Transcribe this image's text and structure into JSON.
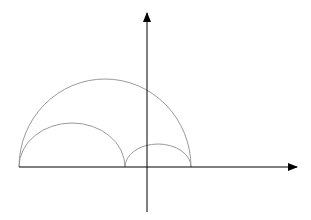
{
  "diagram": {
    "colors": {
      "axis": "#000000",
      "arc": "#9a9a9a",
      "background": "#ffffff"
    },
    "axes": {
      "x_axis": {
        "x1": 19,
        "y": 167,
        "x2": 297,
        "arrow": true
      },
      "y_axis": {
        "x": 147,
        "y1": 212,
        "y2": 13,
        "arrow": true
      }
    },
    "arcs": [
      {
        "name": "large-arc",
        "x_start": 19,
        "x_end": 191,
        "baseline": 167,
        "height": 88
      },
      {
        "name": "medium-arc",
        "x_start": 19,
        "x_end": 125,
        "baseline": 167,
        "height": 44
      },
      {
        "name": "small-arc",
        "x_start": 125,
        "x_end": 191,
        "baseline": 167,
        "height": 23
      }
    ]
  }
}
